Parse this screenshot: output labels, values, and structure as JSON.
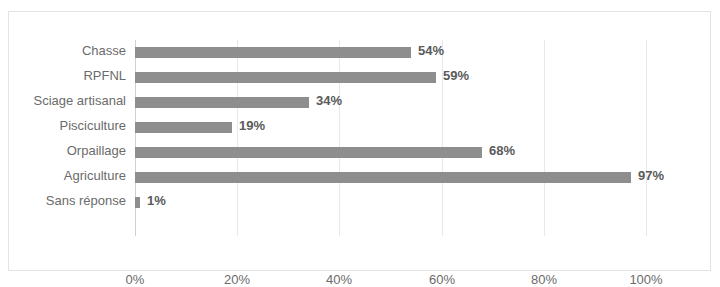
{
  "chart_data": {
    "type": "bar",
    "orientation": "horizontal",
    "title": "",
    "subtitle": "",
    "xlabel": "",
    "ylabel": "",
    "categories": [
      "Chasse",
      "RPFNL",
      "Sciage artisanal",
      "Pisciculture",
      "Orpaillage",
      "Agriculture",
      "Sans réponse"
    ],
    "values": [
      54,
      59,
      34,
      19,
      68,
      97,
      1
    ],
    "data_labels": [
      "54%",
      "59%",
      "34%",
      "19%",
      "68%",
      "97%",
      "1%"
    ],
    "xlim": [
      0,
      100
    ],
    "xticks": [
      0,
      20,
      40,
      60,
      80,
      100
    ],
    "xtick_labels": [
      "0%",
      "20%",
      "40%",
      "60%",
      "80%",
      "100%"
    ],
    "grid": true,
    "grid_axis": "x",
    "legend": false,
    "bar_color": "#8e8e8e",
    "gridline_color": "#e8e8e8",
    "axis_color": "#d0d0d0",
    "label_color": "#6b6b6b",
    "value_color": "#5a5a5a",
    "border_color": "#e3e3e3",
    "background": "#ffffff"
  }
}
